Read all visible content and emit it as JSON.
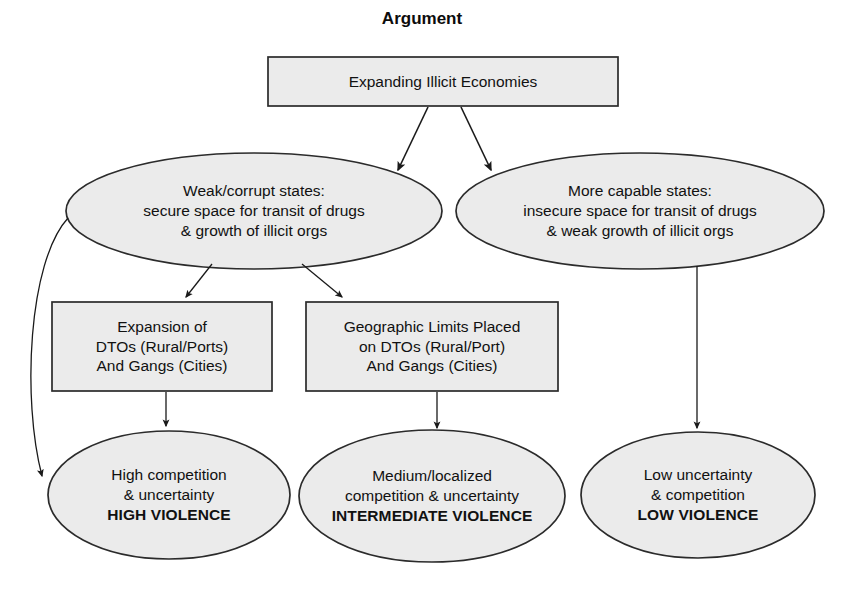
{
  "title": "Argument",
  "colors": {
    "node_fill": "#ebebeb",
    "node_stroke": "#2b2b2b",
    "edge": "#1a1a1a",
    "background": "#ffffff",
    "text": "#111111"
  },
  "nodes": {
    "root_box": {
      "shape": "rectangle",
      "lines": [
        "Expanding Illicit Economies"
      ]
    },
    "left_ellipse": {
      "shape": "ellipse",
      "lines": [
        "Weak/corrupt states:",
        "secure space for transit of drugs",
        "& growth of illicit orgs"
      ]
    },
    "right_ellipse": {
      "shape": "ellipse",
      "lines": [
        "More capable states:",
        "insecure space for transit of drugs",
        "& weak growth of illicit orgs"
      ]
    },
    "mid_box_left": {
      "shape": "rectangle",
      "lines": [
        "Expansion of",
        "DTOs (Rural/Ports)",
        "And Gangs (Cities)"
      ]
    },
    "mid_box_right": {
      "shape": "rectangle",
      "lines": [
        "Geographic Limits Placed",
        "on DTOs (Rural/Port)",
        "And Gangs (Cities)"
      ]
    },
    "outcome_high": {
      "shape": "ellipse",
      "lines": [
        "High competition",
        "& uncertainty"
      ],
      "emphasis": "HIGH VIOLENCE"
    },
    "outcome_intermediate": {
      "shape": "ellipse",
      "lines": [
        "Medium/localized",
        "competition & uncertainty"
      ],
      "emphasis": "INTERMEDIATE VIOLENCE"
    },
    "outcome_low": {
      "shape": "ellipse",
      "lines": [
        "Low uncertainty",
        "& competition"
      ],
      "emphasis": "LOW VIOLENCE"
    }
  },
  "edges": [
    {
      "name": "root-to-left-ellipse",
      "from": "root_box",
      "to": "left_ellipse",
      "style": "arrow"
    },
    {
      "name": "root-to-right-ellipse",
      "from": "root_box",
      "to": "right_ellipse",
      "style": "arrow"
    },
    {
      "name": "left-ellipse-to-mid-box-left",
      "from": "left_ellipse",
      "to": "mid_box_left",
      "style": "arrow"
    },
    {
      "name": "left-ellipse-to-mid-box-right",
      "from": "left_ellipse",
      "to": "mid_box_right",
      "style": "arrow"
    },
    {
      "name": "left-ellipse-to-outcome-high",
      "from": "left_ellipse",
      "to": "outcome_high",
      "style": "curved-arrow"
    },
    {
      "name": "mid-box-left-to-outcome-high",
      "from": "mid_box_left",
      "to": "outcome_high",
      "style": "arrow"
    },
    {
      "name": "mid-box-right-to-outcome-intermediate",
      "from": "mid_box_right",
      "to": "outcome_intermediate",
      "style": "arrow"
    },
    {
      "name": "right-ellipse-to-outcome-low",
      "from": "right_ellipse",
      "to": "outcome_low",
      "style": "arrow"
    }
  ]
}
